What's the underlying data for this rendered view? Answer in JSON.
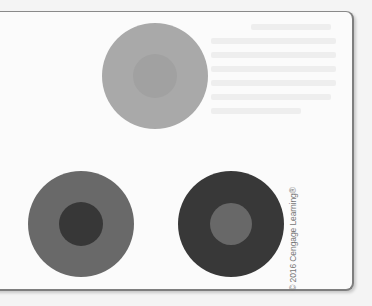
{
  "figure": {
    "circles": [
      {
        "id": "top",
        "outer": {
          "cx": 155,
          "cy": 76,
          "r": 53,
          "color": "#a9a9a9"
        },
        "inner": {
          "r": 22,
          "color": "#a1a1a1"
        }
      },
      {
        "id": "bottom-left",
        "outer": {
          "cx": 81,
          "cy": 224,
          "r": 53,
          "color": "#696969"
        },
        "inner": {
          "r": 22,
          "color": "#373737"
        }
      },
      {
        "id": "bottom-right",
        "outer": {
          "cx": 231,
          "cy": 224,
          "r": 53,
          "color": "#383838"
        },
        "inner": {
          "r": 21,
          "color": "#686868"
        }
      }
    ],
    "credit": "© 2016 Cengage Learning®"
  },
  "colors": {
    "page_background": "#f4f4f4",
    "panel_background": "#fbfbfb",
    "panel_border": "#8a8a8a",
    "credit_text": "#777777"
  }
}
